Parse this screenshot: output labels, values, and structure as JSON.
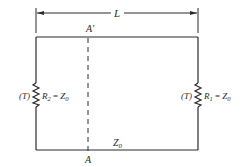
{
  "diagram": {
    "dimension": {
      "label": "L"
    },
    "top_marker": {
      "label": "A'"
    },
    "bottom_marker": {
      "label": "A"
    },
    "bottom_wire": {
      "label": "Z",
      "subscript": "0"
    },
    "left_resistor": {
      "prefix": "(T)",
      "name": "R",
      "name_sub": "2",
      "eq": " = ",
      "value": "Z",
      "value_sub": "0"
    },
    "right_resistor": {
      "prefix": "(T)",
      "name": "R",
      "name_sub": "1",
      "eq": " = ",
      "value": "Z",
      "value_sub": "0"
    },
    "colors": {
      "line": "#2a2a2a",
      "background": "#ffffff"
    }
  }
}
